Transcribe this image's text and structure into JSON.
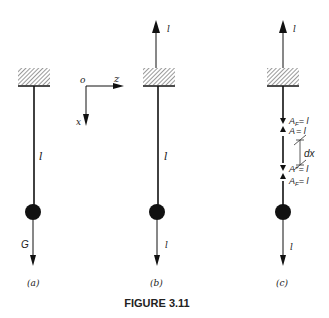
{
  "figure": {
    "caption": "FIGURE 3.11",
    "panels": [
      {
        "id": "a",
        "label": "(a)",
        "rod_label": "l",
        "force_label": "G"
      },
      {
        "id": "b",
        "label": "(b)",
        "rod_label": "l",
        "top_force_label": "l",
        "bottom_force_label": "l"
      },
      {
        "id": "c",
        "label": "(c)",
        "top_force_label": "l",
        "bottom_force_label": "l",
        "annotations": {
          "upper_1": "A",
          "upper_1_sub": "F",
          "upper_1_rhs": "= l",
          "upper_2": "A",
          "upper_2_rhs": "= l",
          "element": "dx",
          "lower_1": "A",
          "lower_1_sup": "+",
          "lower_1_rhs": "= l",
          "lower_2": "A",
          "lower_2_sub": "F",
          "lower_2_rhs": "= l"
        }
      }
    ],
    "axes": {
      "origin": "o",
      "horizontal": "z",
      "vertical": "x"
    }
  },
  "colors": {
    "ink": "#111111",
    "background": "#ffffff"
  }
}
